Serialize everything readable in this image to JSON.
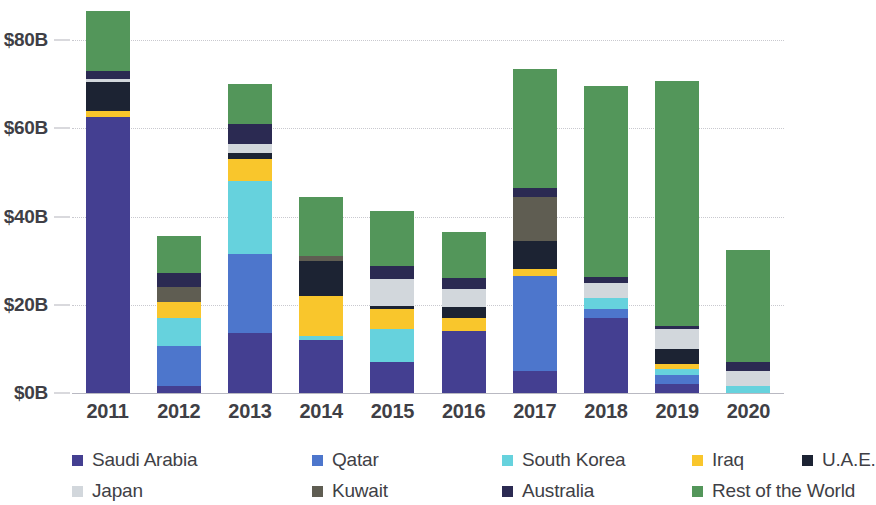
{
  "chart_data": {
    "type": "bar",
    "stacked": true,
    "title": "",
    "subtitle": "",
    "xlabel": "",
    "ylabel": "",
    "categories": [
      "2011",
      "2012",
      "2013",
      "2014",
      "2015",
      "2016",
      "2017",
      "2018",
      "2019",
      "2020"
    ],
    "ytick_labels": [
      "$0B",
      "$20B",
      "$40B",
      "$60B",
      "$80B"
    ],
    "ytick_values": [
      0,
      20,
      40,
      60,
      80
    ],
    "ylim": [
      0,
      88
    ],
    "grid": true,
    "legend_position": "bottom",
    "units": "billions of USD",
    "series": [
      {
        "name": "Saudi Arabia",
        "color": "#443f91",
        "values": [
          62.5,
          1.6,
          13.5,
          12.0,
          7.0,
          14.0,
          5.0,
          17.0,
          2.0,
          0.0
        ]
      },
      {
        "name": "Qatar",
        "color": "#4d76cc",
        "values": [
          0.0,
          9.0,
          18.0,
          0.0,
          0.0,
          0.0,
          21.5,
          2.0,
          2.0,
          0.0
        ]
      },
      {
        "name": "South Korea",
        "color": "#66d2dd",
        "values": [
          0.0,
          6.5,
          16.5,
          1.0,
          7.5,
          0.0,
          0.0,
          2.5,
          1.5,
          1.5
        ]
      },
      {
        "name": "Iraq",
        "color": "#f9c62c",
        "values": [
          1.5,
          3.5,
          5.0,
          9.0,
          4.5,
          3.0,
          1.5,
          0.0,
          1.0,
          0.0
        ]
      },
      {
        "name": "U.A.E.",
        "color": "#1c2333",
        "values": [
          6.5,
          0.0,
          1.5,
          8.0,
          0.8,
          2.5,
          6.5,
          0.0,
          3.5,
          0.0
        ]
      },
      {
        "name": "Japan",
        "color": "#d2d7dc",
        "values": [
          0.7,
          0.0,
          2.0,
          0.0,
          6.0,
          4.0,
          0.0,
          3.5,
          4.5,
          3.5
        ]
      },
      {
        "name": "Kuwait",
        "color": "#5f5d52",
        "values": [
          0.0,
          3.5,
          0.0,
          1.0,
          0.0,
          0.0,
          10.0,
          0.0,
          0.0,
          0.0
        ]
      },
      {
        "name": "Australia",
        "color": "#2b2a52",
        "values": [
          1.8,
          3.0,
          4.5,
          0.0,
          3.0,
          2.5,
          2.0,
          1.2,
          0.8,
          2.0
        ]
      },
      {
        "name": "Rest of the World",
        "color": "#53965a",
        "values": [
          13.5,
          8.5,
          9.0,
          13.5,
          12.5,
          10.5,
          27.0,
          43.5,
          55.5,
          25.5
        ]
      }
    ],
    "totals": [
      86.5,
      35.6,
      70.0,
      44.5,
      41.3,
      36.5,
      73.5,
      69.7,
      70.8,
      32.5
    ]
  },
  "legend": {
    "items": [
      {
        "label": "Saudi Arabia",
        "color": "#443f91"
      },
      {
        "label": "Qatar",
        "color": "#4d76cc"
      },
      {
        "label": "South Korea",
        "color": "#66d2dd"
      },
      {
        "label": "Iraq",
        "color": "#f9c62c"
      },
      {
        "label": "U.A.E.",
        "color": "#1c2333"
      },
      {
        "label": "Japan",
        "color": "#d2d7dc"
      },
      {
        "label": "Kuwait",
        "color": "#5f5d52"
      },
      {
        "label": "Australia",
        "color": "#2b2a52"
      },
      {
        "label": "Rest of the World",
        "color": "#53965a"
      }
    ],
    "row1_x": [
      0,
      240,
      430,
      620,
      730
    ],
    "row2_x": [
      0,
      240,
      430,
      620
    ]
  },
  "style": {
    "background": "#ffffff",
    "gridline_color": "#c9c9cf",
    "axis_color": "#b9b9c2",
    "text_color": "#3f3f46"
  }
}
